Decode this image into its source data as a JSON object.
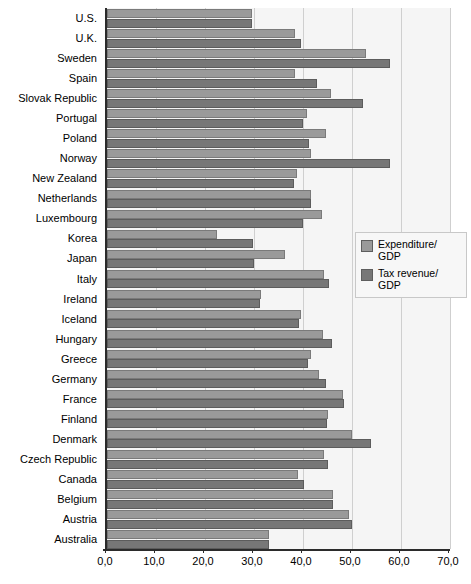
{
  "chart_data": {
    "type": "bar",
    "orientation": "horizontal",
    "title": "",
    "subtitle": "",
    "xlabel": "",
    "ylabel": "",
    "xlim": [
      0.0,
      70.0
    ],
    "xticks": [
      0.0,
      10.0,
      20.0,
      30.0,
      40.0,
      50.0,
      60.0,
      70.0
    ],
    "xtick_labels": [
      "0,0",
      "10,0",
      "20,0",
      "30,0",
      "40,0",
      "50,0",
      "60,0",
      "70,0"
    ],
    "grid": true,
    "grid_axis": "x",
    "legend_position": "right-middle",
    "categories": [
      "U.S.",
      "U.K.",
      "Sweden",
      "Spain",
      "Slovak Republic",
      "Portugal",
      "Poland",
      "Norway",
      "New Zealand",
      "Netherlands",
      "Luxembourg",
      "Korea",
      "Japan",
      "Italy",
      "Ireland",
      "Iceland",
      "Hungary",
      "Greece",
      "Germany",
      "France",
      "Finland",
      "Denmark",
      "Czech Republic",
      "Canada",
      "Belgium",
      "Austria",
      "Australia"
    ],
    "series": [
      {
        "name": "Expenditure/GDP",
        "color": "#9a9a9a",
        "values": [
          29.6,
          38.4,
          52.8,
          38.4,
          45.8,
          40.9,
          44.6,
          41.6,
          38.8,
          41.7,
          43.9,
          22.5,
          36.3,
          44.2,
          31.5,
          39.5,
          44.1,
          41.7,
          43.3,
          48.2,
          45.1,
          50.1,
          44.2,
          38.9,
          46.2,
          49.3,
          33.0
        ]
      },
      {
        "name": "Tax revenue/GDP",
        "color": "#777777",
        "values": [
          29.6,
          39.5,
          57.7,
          42.8,
          52.3,
          40.1,
          41.2,
          57.7,
          38.2,
          41.7,
          40.1,
          29.7,
          30.1,
          45.4,
          31.2,
          39.1,
          45.9,
          41.1,
          44.6,
          48.3,
          44.9,
          53.8,
          45.2,
          40.2,
          46.2,
          50.1,
          33.1
        ]
      }
    ]
  },
  "legend": {
    "items": [
      {
        "label": "Expenditure/\nGDP",
        "color": "#9a9a9a"
      },
      {
        "label": "Tax revenue/\nGDP",
        "color": "#777777"
      }
    ]
  }
}
